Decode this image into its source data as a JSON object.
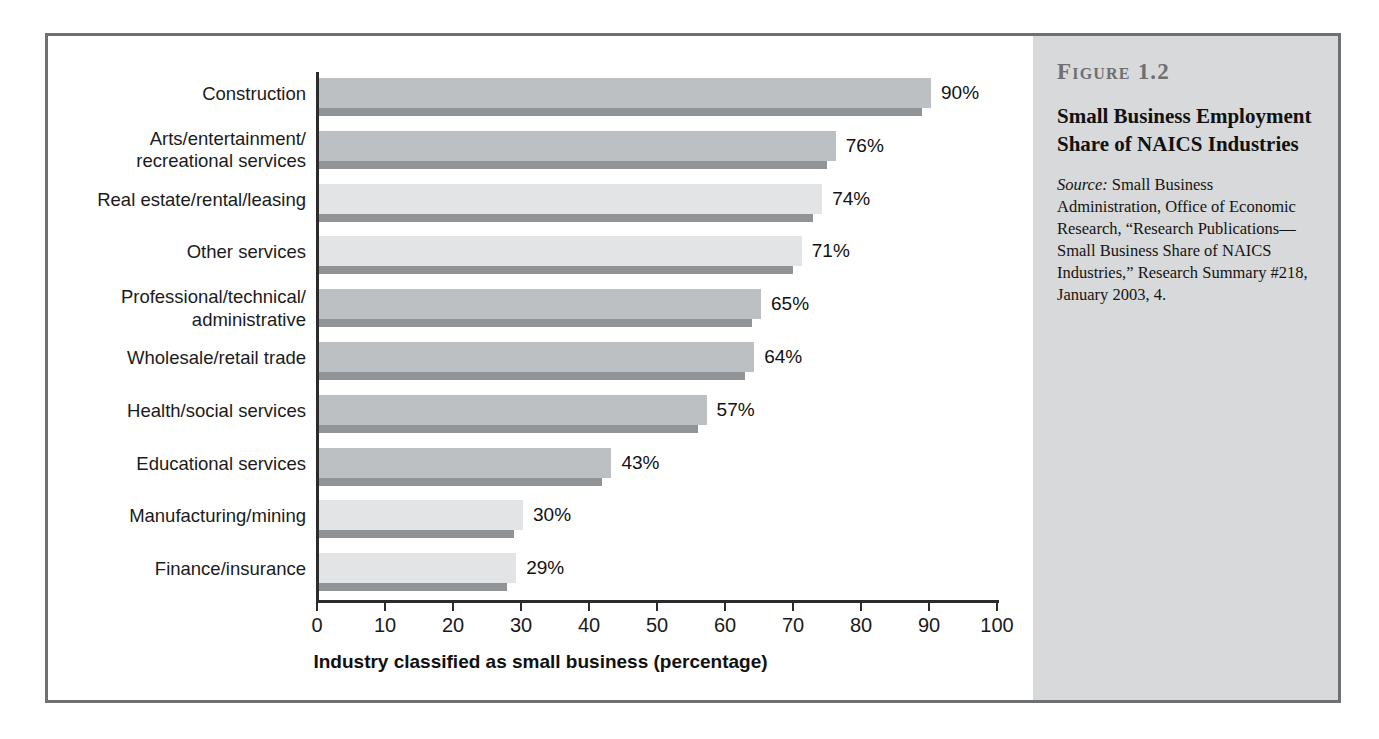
{
  "sidebar": {
    "figure_number": "Figure 1.2",
    "title": "Small Business Employment Share of NAICS Industries",
    "source_label": "Source:",
    "source_text": " Small Business Administration, Office of Economic Research, “Research Publications—Small Business Share of NAICS Industries,” Research Summary #218, January 2003, 4."
  },
  "colors": {
    "frame_border": "#6f7072",
    "sidebar_background": "#d8d9da",
    "bar_dark": "#bdc0c2",
    "bar_light": "#e2e4e5",
    "bar_base": "#909497",
    "axis": "#2b2b2b",
    "figure_number_text": "#6e6f71"
  },
  "chart_data": {
    "type": "bar",
    "orientation": "horizontal",
    "title": "Small Business Employment Share of NAICS Industries",
    "xlabel": "Industry classified as small business (percentage)",
    "ylabel": "",
    "xlim": [
      0,
      100
    ],
    "xticks": [
      0,
      10,
      20,
      30,
      40,
      50,
      60,
      70,
      80,
      90,
      100
    ],
    "grid": false,
    "legend": false,
    "value_suffix": "%",
    "categories": [
      "Construction",
      "Arts/entertainment/ recreational services",
      "Real estate/rental/leasing",
      "Other services",
      "Professional/technical/ administrative",
      "Wholesale/retail trade",
      "Health/social services",
      "Educational services",
      "Manufacturing/mining",
      "Finance/insurance"
    ],
    "values": [
      90,
      76,
      74,
      71,
      65,
      64,
      57,
      43,
      30,
      29
    ],
    "bars": [
      {
        "category_line1": "Construction",
        "category_line2": "",
        "value": 90,
        "label": "90%",
        "shade": "dark"
      },
      {
        "category_line1": "Arts/entertainment/",
        "category_line2": "recreational services",
        "value": 76,
        "label": "76%",
        "shade": "dark"
      },
      {
        "category_line1": "Real estate/rental/leasing",
        "category_line2": "",
        "value": 74,
        "label": "74%",
        "shade": "light"
      },
      {
        "category_line1": "Other services",
        "category_line2": "",
        "value": 71,
        "label": "71%",
        "shade": "light"
      },
      {
        "category_line1": "Professional/technical/",
        "category_line2": "administrative",
        "value": 65,
        "label": "65%",
        "shade": "dark"
      },
      {
        "category_line1": "Wholesale/retail trade",
        "category_line2": "",
        "value": 64,
        "label": "64%",
        "shade": "dark"
      },
      {
        "category_line1": "Health/social services",
        "category_line2": "",
        "value": 57,
        "label": "57%",
        "shade": "dark"
      },
      {
        "category_line1": "Educational services",
        "category_line2": "",
        "value": 43,
        "label": "43%",
        "shade": "dark"
      },
      {
        "category_line1": "Manufacturing/mining",
        "category_line2": "",
        "value": 30,
        "label": "30%",
        "shade": "light"
      },
      {
        "category_line1": "Finance/insurance",
        "category_line2": "",
        "value": 29,
        "label": "29%",
        "shade": "light"
      }
    ]
  }
}
